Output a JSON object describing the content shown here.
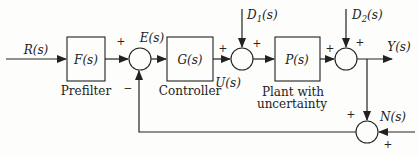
{
  "figure": {
    "background": "#fdfdfb",
    "ink": "#222222",
    "signals": {
      "reference": "R(s)",
      "error": "E(s)",
      "control": "U(s)",
      "output": "Y(s)",
      "noise": "N(s)",
      "disturbance1": {
        "base": "D",
        "sub": "1",
        "arg": "(s)"
      },
      "disturbance2": {
        "base": "D",
        "sub": "2",
        "arg": "(s)"
      }
    },
    "blocks": {
      "prefilter": {
        "symbol": "F(s)",
        "caption": "Prefilter"
      },
      "controller": {
        "symbol": "G(s)",
        "caption": "Controller"
      },
      "plant": {
        "symbol": "P(s)",
        "caption": [
          "Plant with",
          "uncertainty"
        ]
      }
    },
    "signs": {
      "plus": "+",
      "minus": "−"
    }
  }
}
